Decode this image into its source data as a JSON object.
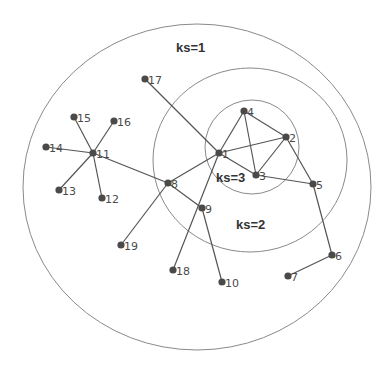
{
  "shells": [
    {
      "label": "ks=1",
      "cx": 197,
      "cy": 187,
      "rx": 174,
      "ry": 163,
      "label_x": 176,
      "label_y": 52
    },
    {
      "label": "ks=2",
      "cx": 250,
      "cy": 160,
      "rx": 97,
      "ry": 92,
      "label_x": 236,
      "label_y": 229
    },
    {
      "label": "ks=3",
      "cx": 252,
      "cy": 147,
      "rx": 47,
      "ry": 47,
      "label_x": 216,
      "label_y": 182
    }
  ],
  "nodes": [
    {
      "id": "1",
      "x": 219,
      "y": 153,
      "shell": 3
    },
    {
      "id": "2",
      "x": 286,
      "y": 137,
      "shell": 3
    },
    {
      "id": "3",
      "x": 256,
      "y": 175,
      "shell": 3
    },
    {
      "id": "4",
      "x": 244,
      "y": 111,
      "shell": 3
    },
    {
      "id": "5",
      "x": 313,
      "y": 184,
      "shell": 2
    },
    {
      "id": "6",
      "x": 332,
      "y": 255,
      "shell": 1
    },
    {
      "id": "7",
      "x": 288,
      "y": 276,
      "shell": 1
    },
    {
      "id": "8",
      "x": 168,
      "y": 183,
      "shell": 2
    },
    {
      "id": "9",
      "x": 202,
      "y": 208,
      "shell": 2
    },
    {
      "id": "10",
      "x": 222,
      "y": 282,
      "shell": 1
    },
    {
      "id": "11",
      "x": 93,
      "y": 153,
      "shell": 1
    },
    {
      "id": "12",
      "x": 102,
      "y": 198,
      "shell": 1
    },
    {
      "id": "13",
      "x": 59,
      "y": 190,
      "shell": 1
    },
    {
      "id": "14",
      "x": 46,
      "y": 147,
      "shell": 1
    },
    {
      "id": "15",
      "x": 74,
      "y": 117,
      "shell": 1
    },
    {
      "id": "16",
      "x": 114,
      "y": 121,
      "shell": 1
    },
    {
      "id": "17",
      "x": 145,
      "y": 79,
      "shell": 1
    },
    {
      "id": "18",
      "x": 173,
      "y": 270,
      "shell": 1
    },
    {
      "id": "19",
      "x": 121,
      "y": 245,
      "shell": 1
    }
  ],
  "edges": [
    [
      "17",
      "1"
    ],
    [
      "1",
      "4"
    ],
    [
      "1",
      "2"
    ],
    [
      "1",
      "3"
    ],
    [
      "1",
      "8"
    ],
    [
      "1",
      "18"
    ],
    [
      "4",
      "2"
    ],
    [
      "4",
      "3"
    ],
    [
      "2",
      "3"
    ],
    [
      "2",
      "5"
    ],
    [
      "3",
      "5"
    ],
    [
      "5",
      "6"
    ],
    [
      "6",
      "7"
    ],
    [
      "8",
      "11"
    ],
    [
      "8",
      "9"
    ],
    [
      "8",
      "19"
    ],
    [
      "9",
      "10"
    ],
    [
      "11",
      "14"
    ],
    [
      "11",
      "15"
    ],
    [
      "11",
      "16"
    ],
    [
      "11",
      "13"
    ],
    [
      "11",
      "12"
    ]
  ],
  "colors": {
    "node": "#4a4a4a",
    "edge": "#555555",
    "shell": "#8a8a8a",
    "label": "#333333"
  }
}
